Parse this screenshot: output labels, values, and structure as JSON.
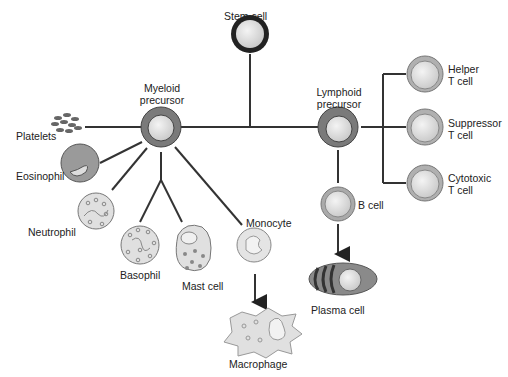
{
  "colors": {
    "line": "#333333",
    "cell_fill": "#e4e4e4",
    "precursor_ring": "#7a7a7a",
    "ring_light": "#b8b8b8",
    "granule": "#8a8a8a"
  },
  "nodes": {
    "stem_cell": "Stem cell",
    "myeloid_precursor": [
      "Myeloid",
      "precursor"
    ],
    "lymphoid_precursor": [
      "Lymphoid",
      "precursor"
    ],
    "platelets": "Platelets",
    "eosinophil": "Eosinophil",
    "neutrophil": "Neutrophil",
    "basophil": "Basophil",
    "mast_cell": "Mast cell",
    "monocyte": "Monocyte",
    "macrophage": "Macrophage",
    "b_cell": "B cell",
    "plasma_cell": "Plasma cell",
    "helper_t": [
      "Helper",
      "T cell"
    ],
    "suppressor_t": [
      "Suppressor",
      "T cell"
    ],
    "cytotoxic_t": [
      "Cytotoxic",
      "T cell"
    ]
  }
}
